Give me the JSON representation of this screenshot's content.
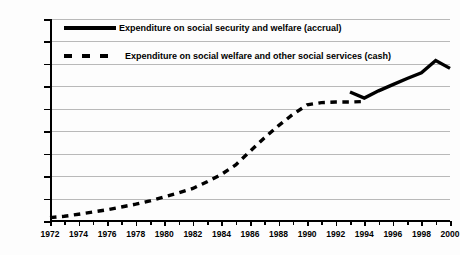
{
  "chart_data": {
    "type": "line",
    "title": "",
    "xlabel": "",
    "ylabel": "",
    "xlim": [
      1972,
      2000
    ],
    "ylim": [
      0,
      18000
    ],
    "ytick_step": 2000,
    "grid": "horizontal",
    "legend_position": "top-left",
    "ytick_labels": [
      "0",
      "2,000",
      "4,000",
      "6,000",
      "8,000",
      "10,000",
      "12,000",
      "14,000",
      "16,000",
      "18,000"
    ],
    "ytick_values": [
      0,
      2000,
      4000,
      6000,
      8000,
      10000,
      12000,
      14000,
      16000,
      18000
    ],
    "xtick_labels": [
      "1972",
      "1974",
      "1976",
      "1978",
      "1980",
      "1982",
      "1984",
      "1986",
      "1988",
      "1990",
      "1992",
      "1994",
      "1996",
      "1998",
      "2000"
    ],
    "xtick_values": [
      1972,
      1974,
      1976,
      1978,
      1980,
      1982,
      1984,
      1986,
      1988,
      1990,
      1992,
      1994,
      1996,
      1998,
      2000
    ],
    "xtick_minor_values": [
      1973,
      1975,
      1977,
      1979,
      1981,
      1983,
      1985,
      1987,
      1989,
      1991,
      1993,
      1995,
      1997,
      1999
    ],
    "series": [
      {
        "name": "Expenditure on social security and welfare (accrual)",
        "style": "solid",
        "color": "#000000",
        "x": [
          1993,
          1994,
          1995,
          1996,
          1997,
          1998,
          1999,
          2000
        ],
        "values": [
          11500,
          10950,
          11600,
          12150,
          12700,
          13200,
          14300,
          13600
        ]
      },
      {
        "name": "Expenditure on social welfare and other social services (cash)",
        "style": "dashed",
        "color": "#000000",
        "x": [
          1972,
          1973,
          1974,
          1975,
          1976,
          1977,
          1978,
          1979,
          1980,
          1981,
          1982,
          1983,
          1984,
          1985,
          1986,
          1987,
          1988,
          1989,
          1990,
          1991,
          1992,
          1993,
          1994
        ],
        "values": [
          300,
          420,
          600,
          800,
          1000,
          1250,
          1500,
          1800,
          2150,
          2500,
          2900,
          3500,
          4150,
          5000,
          6200,
          7400,
          8500,
          9500,
          10350,
          10550,
          10600,
          10600,
          10650
        ]
      }
    ]
  },
  "legend": {
    "items": [
      {
        "label": "Expenditure on social security and welfare (accrual)",
        "style": "solid"
      },
      {
        "label": "Expenditure on social welfare and other social services (cash)",
        "style": "dashed"
      }
    ]
  }
}
